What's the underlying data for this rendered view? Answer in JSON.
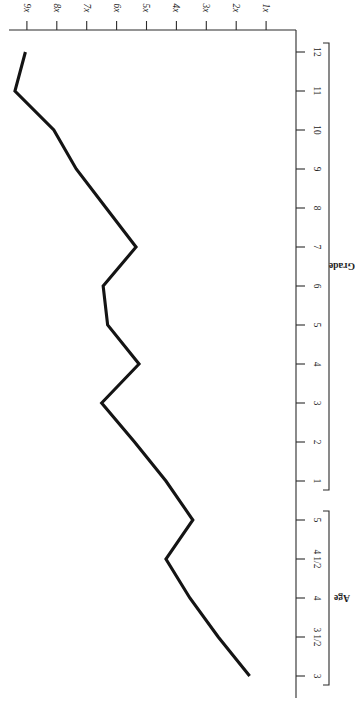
{
  "chart_data": {
    "type": "line",
    "title": "",
    "subtitle": "",
    "orientation": "rotated-180",
    "grid": false,
    "legend": "none",
    "xlabel": "",
    "ylabel": "x = unknown quantity",
    "ylabel_parts": {
      "symbol": "x",
      "rest": " = unknown quantity"
    },
    "ylim": [
      0,
      10
    ],
    "yticks": [
      "1x",
      "2x",
      "3x",
      "4x",
      "5x",
      "6x",
      "7x",
      "8x",
      "9x"
    ],
    "ytick_values": [
      1,
      2,
      3,
      4,
      5,
      6,
      7,
      8,
      9
    ],
    "categories": [
      "3",
      "3 1/2",
      "4",
      "4 1/2",
      "5",
      "1",
      "2",
      "3",
      "4",
      "5",
      "6",
      "7",
      "8",
      "9",
      "10",
      "11",
      "12"
    ],
    "category_groups": [
      {
        "name": "Age",
        "labels": [
          "3",
          "3 1/2",
          "4",
          "4 1/2",
          "5"
        ]
      },
      {
        "name": "Grade",
        "labels": [
          "1",
          "2",
          "3",
          "4",
          "5",
          "6",
          "7",
          "8",
          "9",
          "10",
          "11",
          "12"
        ]
      }
    ],
    "values": [
      1.55,
      2.6,
      3.55,
      4.35,
      3.45,
      4.35,
      5.4,
      6.5,
      5.25,
      6.3,
      6.45,
      5.35,
      6.35,
      7.35,
      8.1,
      9.4,
      9.05
    ],
    "series": [
      {
        "name": "x = unknown quantity",
        "color": "#141414",
        "points": [
          {
            "category": "3",
            "group": "Age",
            "value": 1.55
          },
          {
            "category": "3 1/2",
            "group": "Age",
            "value": 2.6
          },
          {
            "category": "4",
            "group": "Age",
            "value": 3.55
          },
          {
            "category": "4 1/2",
            "group": "Age",
            "value": 4.35
          },
          {
            "category": "5",
            "group": "Age",
            "value": 3.45
          },
          {
            "category": "1",
            "group": "Grade",
            "value": 4.35
          },
          {
            "category": "2",
            "group": "Grade",
            "value": 5.4
          },
          {
            "category": "3",
            "group": "Grade",
            "value": 6.5
          },
          {
            "category": "4",
            "group": "Grade",
            "value": 5.25
          },
          {
            "category": "5",
            "group": "Grade",
            "value": 6.3
          },
          {
            "category": "6",
            "group": "Grade",
            "value": 6.45
          },
          {
            "category": "7",
            "group": "Grade",
            "value": 5.35
          },
          {
            "category": "8",
            "group": "Grade",
            "value": 6.35
          },
          {
            "category": "9",
            "group": "Grade",
            "value": 7.35
          },
          {
            "category": "10",
            "group": "Grade",
            "value": 8.1
          },
          {
            "category": "11",
            "group": "Grade",
            "value": 9.4
          },
          {
            "category": "12",
            "group": "Grade",
            "value": 9.05
          }
        ]
      }
    ],
    "colors": {
      "line": "#141414",
      "axis": "#2b2b2b",
      "text": "#222222",
      "background": "#ffffff"
    }
  }
}
